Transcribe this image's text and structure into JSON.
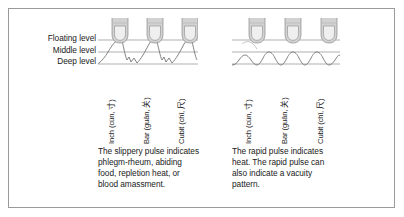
{
  "figure": {
    "background_color": "#ffffff",
    "border_color": "#9a9a9a",
    "line_color": "#8d8d8d",
    "waveform_color": "#6e6e6e",
    "finger_fill": "#d9d9d9",
    "finger_outline": "#8a8a8a",
    "text_color": "#1a1a1a"
  },
  "levels": {
    "floating": "Floating level",
    "middle": "Middle level",
    "deep": "Deep level"
  },
  "positions": {
    "inch": "Inch (cùn, 寸)",
    "bar": "Bar (guān, 关)",
    "cubit": "Cubit (chǐ, 尺)"
  },
  "diagrams": [
    {
      "id": "slippery-pulse",
      "name": "slippery pulse diagram",
      "caption": "The slippery pulse indicates phlegm-rheum, abiding food, repletion heat, or blood amassment."
    },
    {
      "id": "rapid-pulse",
      "name": "rapid pulse diagram",
      "caption": "The rapid pulse indicates heat. The rapid pulse can also indicate a vacuity pattern."
    }
  ]
}
